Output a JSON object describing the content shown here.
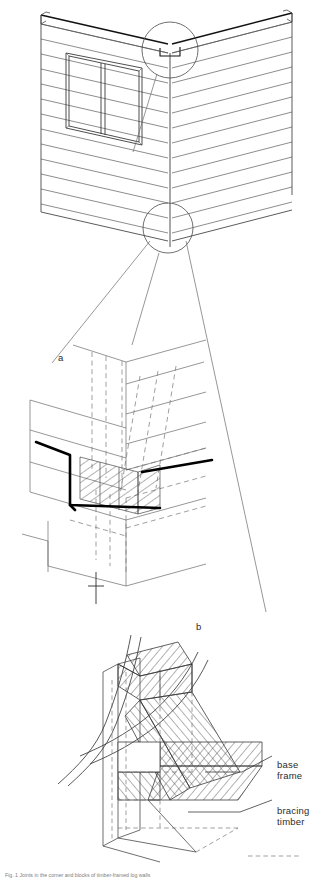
{
  "figure": {
    "type": "technical-architectural-drawing",
    "panels": [
      {
        "id": "overview",
        "name": "building-corner-isometric",
        "description": "Isometric view of log-walled building corner with window on left face, horizontal log courses, and two circular detail callouts",
        "callout_labels": []
      },
      {
        "id": "detail-a",
        "label": "a",
        "name": "corner-notch-joint-detail",
        "description": "Enlarged corner log notch joint, bold section cut outline with hatched cross section and dashed hidden lines"
      },
      {
        "id": "detail-b",
        "label": "b",
        "name": "base-frame-bracing-detail",
        "description": "Enlarged base frame corner post with bracing timbers, hatched timber sections"
      }
    ],
    "detail_labels": {
      "a": "a",
      "b": "b"
    },
    "annotations": [
      {
        "name": "base-frame-label",
        "text": "base\nframe"
      },
      {
        "name": "bracing-timber-label",
        "text": "bracing\ntimber"
      }
    ],
    "caption": "Fig. 1  Joints in the corner and blocks of timber-framed log walls",
    "colors": {
      "line": "#3a3a3a",
      "thin_line": "#6b6b6b",
      "hidden_line": "#7a7a7a",
      "bold_cut": "#000000",
      "hatch": "#444444",
      "background": "#ffffff",
      "label_text": "#2b2b2b",
      "caption_text": "#7d7d7d"
    }
  }
}
